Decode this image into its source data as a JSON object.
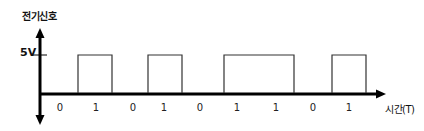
{
  "chart_data": {
    "type": "line",
    "subtype": "digital-square-wave",
    "title": "",
    "ylabel": "전기신호",
    "xlabel": "시간(T)",
    "y_tick_labels": [
      "5V"
    ],
    "high_level": "5V",
    "low_level": "0V",
    "bits": [
      "0",
      "1",
      "0",
      "1",
      "0",
      "1",
      "1",
      "0",
      "1"
    ],
    "values": [
      0,
      1,
      0,
      1,
      0,
      1,
      1,
      0,
      1
    ],
    "grid": false,
    "legend": null
  },
  "labels": {
    "y_axis_title": "전기신호",
    "level_high": "5V",
    "x_axis_title": "시간(T)"
  },
  "colors": {
    "axis": "#000000",
    "signal": "#333333",
    "text": "#111111"
  }
}
